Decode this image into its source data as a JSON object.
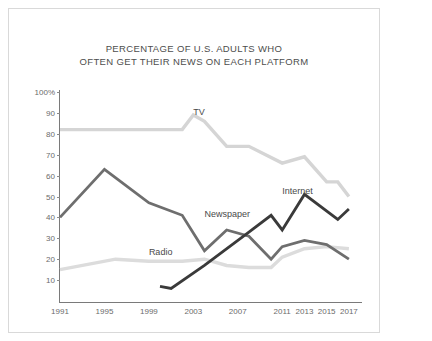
{
  "document": {
    "title_line1": "PERCENTAGE OF U.S. ADULTS WHO",
    "title_line2": "OFTEN GET THEIR NEWS ON EACH PLATFORM"
  },
  "rail": {
    "scrollbar_name": "vertical-scrollbar"
  },
  "chart_data": {
    "type": "line",
    "title": "PERCENTAGE OF U.S. ADULTS WHO OFTEN GET THEIR NEWS ON EACH PLATFORM",
    "xlabel": "",
    "ylabel": "",
    "xlim": [
      1991,
      2018
    ],
    "ylim": [
      0,
      100
    ],
    "grid": false,
    "legend_position": "inline-labels",
    "y_ticks": [
      "100%",
      "90",
      "80",
      "70",
      "60",
      "50",
      "40",
      "30",
      "20",
      "10"
    ],
    "y_tick_values": [
      100,
      90,
      80,
      70,
      60,
      50,
      40,
      30,
      20,
      10
    ],
    "x_ticks": [
      "1991",
      "1995",
      "1999",
      "2003",
      "2007",
      "2011",
      "2013",
      "2015",
      "2017"
    ],
    "x_tick_values": [
      1991,
      1995,
      1999,
      2003,
      2007,
      2011,
      2013,
      2015,
      2017
    ],
    "series": [
      {
        "name": "TV",
        "color": "#d5d5d5",
        "label_x": 2003,
        "label_y": 93,
        "x": [
          1991,
          1995,
          1999,
          2002,
          2003,
          2004,
          2006,
          2008,
          2011,
          2013,
          2015,
          2016,
          2017
        ],
        "values": [
          82,
          82,
          82,
          82,
          89,
          86,
          74,
          74,
          66,
          69,
          57,
          57,
          50
        ]
      },
      {
        "name": "Newspaper",
        "color": "#6e6e6e",
        "label_x": 2004,
        "label_y": 44,
        "x": [
          1991,
          1995,
          1999,
          2002,
          2004,
          2006,
          2008,
          2010,
          2011,
          2013,
          2015,
          2017
        ],
        "values": [
          40,
          63,
          47,
          41,
          24,
          34,
          31,
          20,
          26,
          29,
          27,
          20
        ]
      },
      {
        "name": "Internet",
        "color": "#3a3a3a",
        "label_x": 2011,
        "label_y": 55,
        "x": [
          2000,
          2001,
          2004,
          2008,
          2010,
          2011,
          2013,
          2016,
          2017
        ],
        "values": [
          7,
          6,
          17,
          33,
          41,
          34,
          51,
          39,
          44
        ]
      },
      {
        "name": "Radio",
        "color": "#dcdcdc",
        "label_x": 1999,
        "label_y": 26,
        "x": [
          1991,
          1996,
          1999,
          2002,
          2004,
          2006,
          2008,
          2010,
          2011,
          2013,
          2015,
          2017
        ],
        "values": [
          15,
          20,
          19,
          19,
          20,
          17,
          16,
          16,
          21,
          25,
          26,
          25
        ]
      }
    ]
  }
}
